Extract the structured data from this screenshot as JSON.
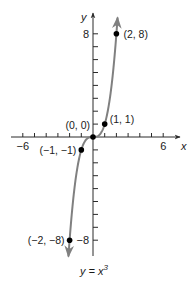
{
  "chart_data": {
    "type": "line",
    "title": "",
    "function_label": "y = x",
    "function_exponent": "3",
    "xlabel": "x",
    "ylabel": "y",
    "xlim": [
      -7,
      7
    ],
    "ylim": [
      -9,
      9
    ],
    "x_tick_step": 1,
    "y_tick_step": 1,
    "x_tick_labels": [
      {
        "value": -6,
        "label": "−6"
      },
      {
        "value": 6,
        "label": "6"
      }
    ],
    "y_tick_labels": [
      {
        "value": 8,
        "label": "8"
      },
      {
        "value": -8,
        "label": "−8"
      }
    ],
    "grid": false,
    "series": [
      {
        "name": "y = x^3",
        "color": "#808080",
        "x": [
          -2,
          -1.5,
          -1,
          -0.5,
          0,
          0.5,
          1,
          1.5,
          2
        ],
        "y": [
          -8,
          -3.375,
          -1,
          -0.125,
          0,
          0.125,
          1,
          3.375,
          8
        ]
      }
    ],
    "points": [
      {
        "x": -2,
        "y": -8,
        "label": "(−2, −8)"
      },
      {
        "x": -1,
        "y": -1,
        "label": "(−1, −1)"
      },
      {
        "x": 0,
        "y": 0,
        "label": "(0, 0)"
      },
      {
        "x": 1,
        "y": 1,
        "label": "(1, 1)"
      },
      {
        "x": 2,
        "y": 8,
        "label": "(2, 8)"
      }
    ]
  },
  "colors": {
    "axis": "#2a2a2a",
    "curve": "#808080",
    "point": "#000000"
  }
}
